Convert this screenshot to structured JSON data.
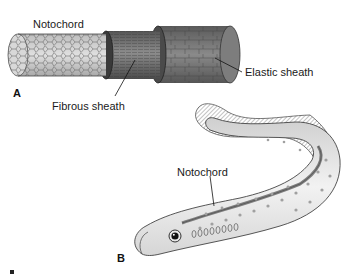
{
  "figure": {
    "panel_a": {
      "panel_label": "A",
      "labels": {
        "notochord": "Notochord",
        "fibrous_sheath": "Fibrous sheath",
        "elastic_sheath": "Elastic sheath"
      }
    },
    "panel_b": {
      "panel_label": "B",
      "labels": {
        "notochord": "Notochord"
      }
    },
    "colors": {
      "notochord_cells": "#cfcfcf",
      "fibrous_sheath": "#6e6e6e",
      "elastic_sheath": "#777777",
      "fish_body": "#e8e8e8",
      "fish_spots": "#9a9a9a",
      "fish_notochord": "#8a8a8a"
    }
  }
}
